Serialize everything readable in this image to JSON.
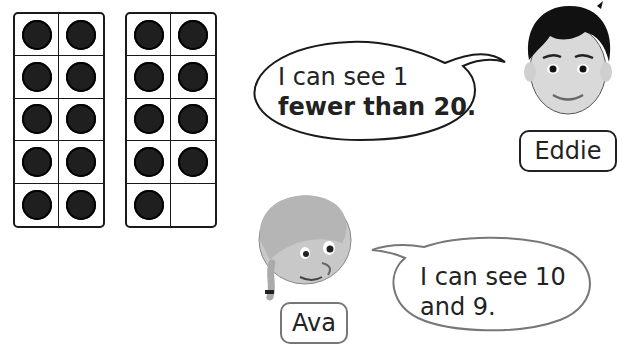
{
  "ten_frames": [
    {
      "filled": 10,
      "total": 10
    },
    {
      "filled": 9,
      "total": 10
    }
  ],
  "speech_bubbles": {
    "eddie": {
      "line1": "I can see 1",
      "line2": "fewer than 20."
    },
    "ava": {
      "line1": "I can see 10",
      "line2": "and 9."
    }
  },
  "characters": {
    "eddie": {
      "name": "Eddie",
      "icon": "boy-face-icon"
    },
    "ava": {
      "name": "Ava",
      "icon": "girl-face-icon"
    }
  },
  "colors": {
    "counter": "#1f1f1f",
    "outline": "#1a1a1a",
    "ava_bubble_outline": "#777777"
  }
}
